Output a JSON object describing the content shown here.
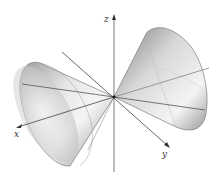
{
  "figure": {
    "axes": {
      "x_label": "x",
      "y_label": "y",
      "z_label": "z"
    },
    "colors": {
      "axis": "#555555",
      "surface_dark": "#8a8a8a",
      "surface_light": "#f2f2f2",
      "edge": "#6a6a6a"
    }
  }
}
